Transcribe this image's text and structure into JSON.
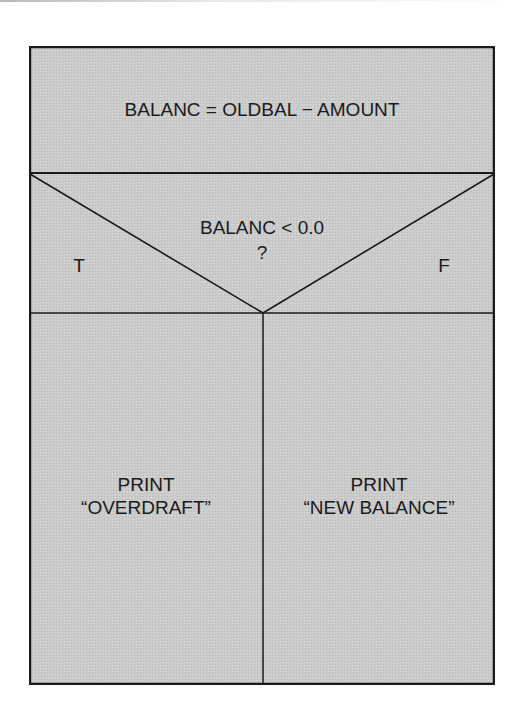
{
  "diagram": {
    "type": "Nassi-Shneiderman structured flowchart",
    "colors": {
      "fill": "#c8c8c8",
      "line": "#1a1a1a",
      "text": "#1a1a1a",
      "background": "#ffffff"
    },
    "process_block": {
      "label": "BALANC = OLDBAL − AMOUNT"
    },
    "decision_block": {
      "condition": "BALANC < 0.0",
      "question_mark": "?",
      "true_label": "T",
      "false_label": "F"
    },
    "branches": {
      "true_branch": {
        "line1": "PRINT",
        "line2": "“OVERDRAFT”"
      },
      "false_branch": {
        "line1": "PRINT",
        "line2": "“NEW BALANCE”"
      }
    }
  }
}
